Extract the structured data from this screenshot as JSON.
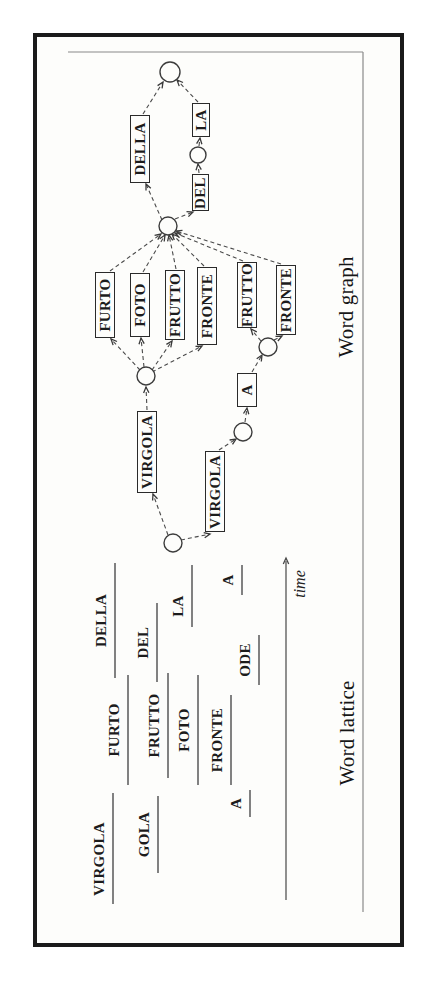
{
  "figure": {
    "kind": "scanned paper figure, rotated 90 degrees counter-clockwise on the page",
    "paper_color": "#fdfdfb",
    "ink_color": "#1c1c1c",
    "edge_color": "#4a4a4a",
    "rule_color": "#8a8a8a"
  },
  "frame": {
    "rules": [
      {
        "name": "inner-rule-right",
        "x1": 947,
        "y1": 68,
        "x2": 947,
        "y2": 363
      },
      {
        "name": "inner-rule-bottom",
        "x1": 87,
        "y1": 363,
        "x2": 947,
        "y2": 363
      }
    ]
  },
  "lattice": {
    "caption": "Word lattice",
    "time_label": "time",
    "axis": {
      "y": 286,
      "x1": 99,
      "x2": 441
    },
    "words": [
      {
        "label": "VIRGOLA",
        "y": 113,
        "x1": 95,
        "x2": 206,
        "lx": 140
      },
      {
        "label": "DELLA",
        "y": 115,
        "x1": 321,
        "x2": 436
      },
      {
        "label": "FURTO",
        "y": 128,
        "x1": 214,
        "x2": 324
      },
      {
        "label": "DEL",
        "y": 157,
        "x1": 317,
        "x2": 396
      },
      {
        "label": "GOLA",
        "y": 158,
        "x1": 126,
        "x2": 203
      },
      {
        "label": "FRUTTO",
        "y": 168,
        "x1": 221,
        "x2": 326
      },
      {
        "label": "LA",
        "y": 192,
        "x1": 372,
        "x2": 434,
        "lx": 393
      },
      {
        "label": "FOTO",
        "y": 198,
        "x1": 214,
        "x2": 324
      },
      {
        "label": "FRONTE",
        "y": 231,
        "x1": 214,
        "x2": 304
      },
      {
        "label": "A",
        "y": 242,
        "x1": 404,
        "x2": 434
      },
      {
        "label": "A",
        "y": 250,
        "x1": 182,
        "x2": 209
      },
      {
        "label": "ODE",
        "y": 259,
        "x1": 314,
        "x2": 364
      }
    ]
  },
  "graph": {
    "caption": "Word graph",
    "nodes": [
      {
        "id": "start",
        "cx": 456,
        "cy": 173,
        "r": 9
      },
      {
        "id": "after-virgola",
        "cx": 567,
        "cy": 243,
        "r": 9
      },
      {
        "id": "upper-mid",
        "cx": 623,
        "cy": 146,
        "r": 9
      },
      {
        "id": "after-a",
        "cx": 652,
        "cy": 268,
        "r": 9
      },
      {
        "id": "hub",
        "cx": 773,
        "cy": 168,
        "r": 9
      },
      {
        "id": "after-del",
        "cx": 844,
        "cy": 198,
        "r": 8
      },
      {
        "id": "final",
        "cx": 927,
        "cy": 170,
        "r": 10
      }
    ],
    "boxes": [
      {
        "label": "VIRGOLA",
        "cx": 547,
        "cy": 147,
        "w": 82,
        "h": 20
      },
      {
        "label": "VIRGOLA",
        "cx": 507,
        "cy": 215,
        "w": 81,
        "h": 20
      },
      {
        "label": "A",
        "cx": 609,
        "cy": 247,
        "w": 34,
        "h": 20
      },
      {
        "label": "FURTO",
        "cx": 694,
        "cy": 105,
        "w": 66,
        "h": 20
      },
      {
        "label": "FOTO",
        "cx": 694,
        "cy": 140,
        "w": 64,
        "h": 20
      },
      {
        "label": "FRUTTO",
        "cx": 694,
        "cy": 175,
        "w": 70,
        "h": 20
      },
      {
        "label": "FRONTE",
        "cx": 693,
        "cy": 207,
        "w": 78,
        "h": 20
      },
      {
        "label": "FRUTTO",
        "cx": 704,
        "cy": 247,
        "w": 66,
        "h": 20
      },
      {
        "label": "FRONTE",
        "cx": 699,
        "cy": 286,
        "w": 70,
        "h": 20
      },
      {
        "label": "DEL",
        "cx": 806,
        "cy": 200,
        "w": 37,
        "h": 17
      },
      {
        "label": "LA",
        "cx": 879,
        "cy": 201,
        "w": 34,
        "h": 18
      },
      {
        "label": "DELLA",
        "cx": 850,
        "cy": 140,
        "w": 68,
        "h": 20
      }
    ],
    "edges": [
      {
        "x1": 464,
        "y1": 168,
        "x2": 505,
        "y2": 153
      },
      {
        "x1": 459,
        "y1": 181,
        "x2": 465,
        "y2": 210
      },
      {
        "x1": 589,
        "y1": 147,
        "x2": 612,
        "y2": 146
      },
      {
        "x1": 549,
        "y1": 219,
        "x2": 560,
        "y2": 236
      },
      {
        "x1": 577,
        "y1": 245,
        "x2": 591,
        "y2": 247
      },
      {
        "x1": 627,
        "y1": 252,
        "x2": 644,
        "y2": 262
      },
      {
        "x1": 629,
        "y1": 140,
        "x2": 660,
        "y2": 111
      },
      {
        "x1": 632,
        "y1": 144,
        "x2": 661,
        "y2": 141
      },
      {
        "x1": 629,
        "y1": 152,
        "x2": 658,
        "y2": 172
      },
      {
        "x1": 627,
        "y1": 152,
        "x2": 653,
        "y2": 202
      },
      {
        "x1": 658,
        "y1": 261,
        "x2": 670,
        "y2": 251
      },
      {
        "x1": 659,
        "y1": 274,
        "x2": 663,
        "y2": 282
      },
      {
        "x1": 728,
        "y1": 110,
        "x2": 765,
        "y2": 161
      },
      {
        "x1": 727,
        "y1": 143,
        "x2": 764,
        "y2": 165
      },
      {
        "x1": 730,
        "y1": 176,
        "x2": 764,
        "y2": 169
      },
      {
        "x1": 733,
        "y1": 204,
        "x2": 765,
        "y2": 172
      },
      {
        "x1": 738,
        "y1": 243,
        "x2": 766,
        "y2": 175
      },
      {
        "x1": 735,
        "y1": 281,
        "x2": 768,
        "y2": 176
      },
      {
        "x1": 779,
        "y1": 162,
        "x2": 815,
        "y2": 146
      },
      {
        "x1": 780,
        "y1": 175,
        "x2": 787,
        "y2": 193
      },
      {
        "x1": 885,
        "y1": 143,
        "x2": 917,
        "y2": 163
      },
      {
        "x1": 826,
        "y1": 199,
        "x2": 835,
        "y2": 198
      },
      {
        "x1": 853,
        "y1": 199,
        "x2": 861,
        "y2": 200
      },
      {
        "x1": 897,
        "y1": 198,
        "x2": 919,
        "y2": 177
      }
    ]
  }
}
